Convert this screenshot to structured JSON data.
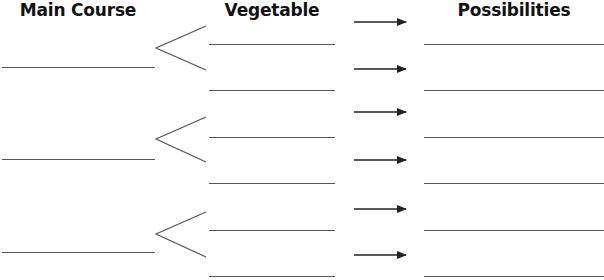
{
  "headers": {
    "main_course": "Main Course",
    "vegetable": "Vegetable",
    "possibilities": "Possibilities"
  },
  "colors": {
    "line": "#555555",
    "arrow": "#222222",
    "text": "#111111"
  },
  "layout": {
    "main_course_blanks": [
      67,
      159,
      252
    ],
    "chevrons": [
      {
        "apex_y": 48,
        "top_y": 26,
        "bottom_y": 70
      },
      {
        "apex_y": 139,
        "top_y": 117,
        "bottom_y": 162
      },
      {
        "apex_y": 234,
        "top_y": 212,
        "bottom_y": 257
      }
    ],
    "vegetable_blanks": [
      44,
      90,
      137,
      183,
      230,
      276
    ],
    "arrows": [
      22,
      69,
      112,
      160,
      209,
      255
    ],
    "possibility_blanks": [
      44,
      90,
      137,
      183,
      230,
      276
    ]
  },
  "fields": {
    "main_course": [
      "",
      "",
      ""
    ],
    "vegetable": [
      "",
      "",
      "",
      "",
      "",
      ""
    ],
    "possibilities": [
      "",
      "",
      "",
      "",
      "",
      ""
    ]
  }
}
